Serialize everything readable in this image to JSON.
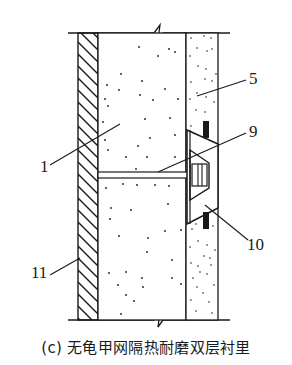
{
  "figure": {
    "caption": "(c) 无龟甲网隔热耐磨双层衬里",
    "labels": {
      "l1": "1",
      "l5": "5",
      "l9": "9",
      "l10": "10",
      "l11": "11"
    },
    "components": [
      {
        "id": "1",
        "description": "insulating layer (dotted, thick)"
      },
      {
        "id": "5",
        "description": "wear-resistant layer (dotted, thin)"
      },
      {
        "id": "9",
        "description": "anchor rod"
      },
      {
        "id": "10",
        "description": "anchor plate (trapezoid)"
      },
      {
        "id": "11",
        "description": "shell wall (hatched)"
      }
    ],
    "colors": {
      "line": "#1a1a1a",
      "background": "#ffffff"
    }
  }
}
